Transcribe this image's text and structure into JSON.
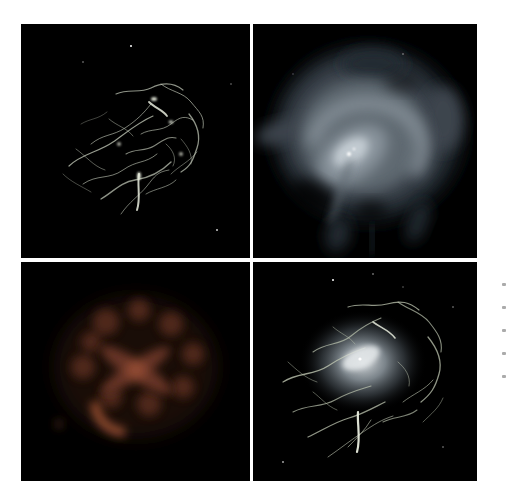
{
  "page": {
    "background": "#ffffff"
  },
  "colors": {
    "page_bg": "#ffffff",
    "panel_bg": "#000000",
    "p1_filament": "#c9d0bf",
    "p1_knot": "#e9edde",
    "p2_outer": "#232a30",
    "p2_mid": "#3d454d",
    "p2_inner": "#5f6971",
    "p2_swirl": "#8a949d",
    "p2_bright": "#c2cbd1",
    "p2_core": "#ffffff",
    "p3_halo": "#2a140e",
    "p3_clump": "#542a1f",
    "p3_cross": "#6b3726",
    "p3_arc": "#9c5134",
    "p4_filament": "#bfc7b2",
    "p4_glow_in": "#e3e7e9",
    "p4_glow_mid": "#9aa5ad",
    "p4_glow_out": "#4c555c",
    "p4_core": "#ffffff",
    "star": "#ffffff",
    "caption_mark": "#8f8f8f"
  },
  "panels": [
    {
      "id": "top-left",
      "semantic": "filamentary-nebula-photo"
    },
    {
      "id": "top-right",
      "semantic": "diffuse-nebula-with-pulsar-and-jet-photo"
    },
    {
      "id": "bottom-left",
      "semantic": "faint-red-clumpy-infrared-nebula-photo"
    },
    {
      "id": "bottom-right",
      "semantic": "filamentary-nebula-with-bright-core-photo"
    }
  ],
  "caption_marks": {
    "x": 502,
    "ys": [
      283,
      306,
      329,
      352,
      375
    ],
    "width": 4,
    "height": 3
  }
}
